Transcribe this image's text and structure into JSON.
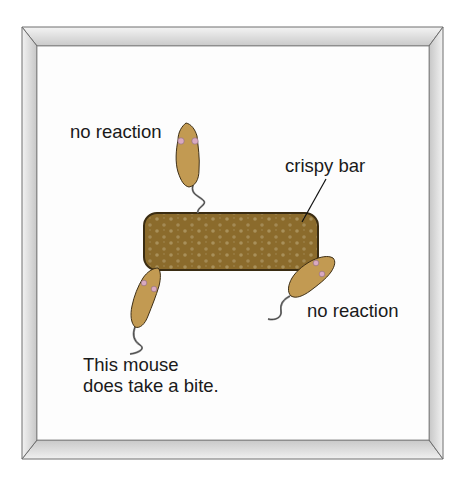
{
  "figure": {
    "type": "illustration",
    "frame": {
      "outer_color": "#d9d9d9",
      "inner_background": "#fdfdfd",
      "edge_color": "#6e6e6e"
    },
    "bar": {
      "label": "crispy bar",
      "fill_color": "#8b6b2c",
      "dot_color": "#a8905a",
      "outline_color": "#3a2c12"
    },
    "mice": [
      {
        "position": "top",
        "label": "no reaction",
        "body_color": "#c29a52"
      },
      {
        "position": "right",
        "label": "no reaction",
        "body_color": "#c29a52"
      },
      {
        "position": "bottom-left",
        "label_lines": [
          "This mouse",
          "does take a bite."
        ],
        "body_color": "#c29a52"
      }
    ]
  }
}
